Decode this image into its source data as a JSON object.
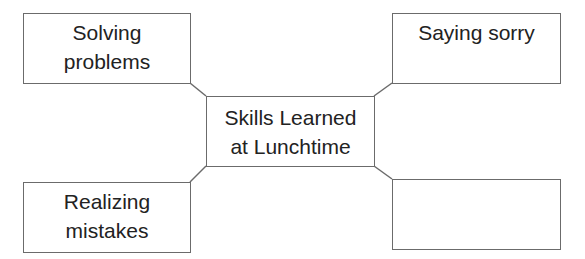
{
  "diagram": {
    "type": "concept-map",
    "center": {
      "lines": [
        "Skills Learned",
        "at Lunchtime"
      ]
    },
    "nodes": [
      {
        "position": "top-left",
        "lines": [
          "Solving",
          "problems"
        ]
      },
      {
        "position": "top-right",
        "lines": [
          "Saying sorry"
        ]
      },
      {
        "position": "bottom-left",
        "lines": [
          "Realizing",
          "mistakes"
        ]
      },
      {
        "position": "bottom-right",
        "lines": []
      }
    ],
    "colors": {
      "border": "#6b6b6b",
      "text": "#222222",
      "background": "#ffffff"
    }
  }
}
